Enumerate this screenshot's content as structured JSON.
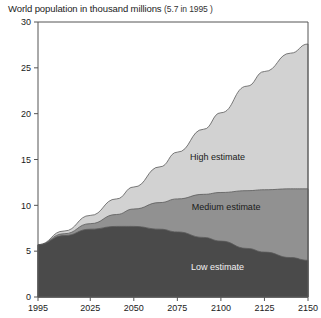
{
  "chart": {
    "title_main": "World population in thousand millions",
    "title_note": "(5.7 in 1995 )"
  },
  "labels": {
    "high": "High estimate",
    "medium": "Medium estimate",
    "low": "Low estimate"
  },
  "colors": {
    "high_band": "#d2d2d2",
    "medium_band": "#919191",
    "low_band": "#4a4a4a",
    "axis": "#555555",
    "background": "#ffffff",
    "text": "#1a1a1a"
  },
  "chart_data": {
    "type": "area",
    "title": "World population in thousand millions (5.7 in 1995 )",
    "xlabel": "",
    "ylabel": "",
    "xlim": [
      1995,
      2150
    ],
    "ylim": [
      0,
      30
    ],
    "grid": false,
    "legend": "inline-band-labels",
    "stacked": false,
    "xticks": [
      1995,
      2025,
      2050,
      2075,
      2100,
      2125,
      2150
    ],
    "yticks": [
      0,
      5,
      10,
      15,
      20,
      25,
      30
    ],
    "x": [
      1995,
      2010,
      2025,
      2040,
      2050,
      2065,
      2075,
      2090,
      2100,
      2115,
      2125,
      2140,
      2150
    ],
    "series": [
      {
        "name": "High estimate",
        "label": "High estimate",
        "color": "#d2d2d2",
        "values": [
          5.7,
          7.2,
          8.9,
          10.7,
          12.0,
          14.2,
          15.8,
          18.3,
          20.1,
          23.0,
          24.6,
          26.6,
          27.6
        ]
      },
      {
        "name": "Medium estimate",
        "label": "Medium estimate",
        "color": "#919191",
        "values": [
          5.7,
          6.9,
          8.0,
          9.0,
          9.6,
          10.3,
          10.7,
          11.2,
          11.4,
          11.6,
          11.7,
          11.8,
          11.8
        ]
      },
      {
        "name": "Low estimate",
        "label": "Low estimate",
        "color": "#4a4a4a",
        "values": [
          5.7,
          6.7,
          7.4,
          7.7,
          7.7,
          7.4,
          7.1,
          6.5,
          6.1,
          5.3,
          4.9,
          4.3,
          4.0
        ]
      }
    ]
  }
}
